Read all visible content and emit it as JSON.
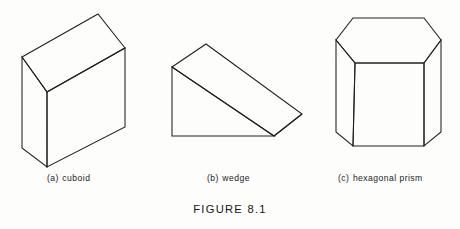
{
  "figure": {
    "title": "FIGURE 8.1",
    "background_color": "#fdfdfb",
    "line_color": "#20201f",
    "text_color": "#1c1c1b"
  },
  "shapes": [
    {
      "id": "cuboid",
      "label_tag": "(a)",
      "label_name": "cuboid",
      "caption": "(a) cuboid",
      "type": "3d-solid-wireframe",
      "description": "rectangular box drawn in oblique projection, top face and two side faces visible",
      "vertices": {
        "top_back_left": [
          22,
          57
        ],
        "top_back_right": [
          98,
          14
        ],
        "top_front_right": [
          125,
          48
        ],
        "top_front_left": [
          47,
          92
        ],
        "bottom_front_left": [
          47,
          167
        ],
        "bottom_left": [
          22,
          148
        ],
        "bottom_front_right": [
          125,
          127
        ]
      }
    },
    {
      "id": "wedge",
      "label_tag": "(b)",
      "label_name": "wedge",
      "caption": "(b) wedge",
      "type": "3d-solid-wireframe",
      "description": "triangular prism lying on its side forming a ramp, sloping top face visible",
      "vertices": {
        "apex_back": [
          206,
          44
        ],
        "apex_front_left": [
          172,
          67
        ],
        "base_front_left": [
          172,
          136
        ],
        "base_front_right": [
          274,
          136
        ],
        "base_back_right": [
          302,
          114
        ]
      }
    },
    {
      "id": "hexagonal-prism",
      "label_tag": "(c)",
      "label_name": "hexagonal prism",
      "caption": "(c) hexagonal prism",
      "type": "3d-solid-wireframe",
      "description": "upright hexagonal prism, top hexagonal face and three rectangular side faces visible",
      "vertices": {
        "top_back_left": [
          353,
          18
        ],
        "top_back_right": [
          424,
          18
        ],
        "top_right": [
          441,
          40
        ],
        "top_front_right": [
          424,
          63
        ],
        "top_front_left": [
          355,
          63
        ],
        "top_left": [
          336,
          40
        ],
        "bottom_left": [
          336,
          132
        ],
        "bottom_front_left": [
          353,
          146
        ],
        "bottom_front_right": [
          424,
          146
        ],
        "bottom_right": [
          441,
          132
        ]
      }
    }
  ]
}
